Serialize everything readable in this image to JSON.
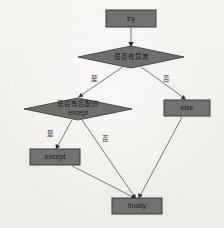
{
  "diagram": {
    "type": "flowchart",
    "background_color": "#f3f2ef",
    "node_fill_color": "#727272",
    "node_stroke_color": "#3a3a3a",
    "edge_color": "#6a6a6a",
    "nodes": [
      {
        "id": "try",
        "shape": "rect",
        "label": "try",
        "label_line2": "",
        "x": 131,
        "y": 18,
        "w": 50,
        "h": 17
      },
      {
        "id": "has-exception",
        "shape": "diamond",
        "label": "是否有异常",
        "label_line2": "",
        "x": 131,
        "y": 57,
        "w": 105,
        "h": 22
      },
      {
        "id": "has-matching-except",
        "shape": "diamond",
        "label": "是否有匹配的",
        "label_line2": "except",
        "x": 78,
        "y": 109,
        "w": 108,
        "h": 22
      },
      {
        "id": "else",
        "shape": "rect",
        "label": "else",
        "label_line2": "",
        "x": 187,
        "y": 108,
        "w": 46,
        "h": 16
      },
      {
        "id": "except",
        "shape": "rect",
        "label": "except",
        "label_line2": "",
        "x": 55,
        "y": 157,
        "w": 50,
        "h": 16
      },
      {
        "id": "finally",
        "shape": "rect",
        "label": "finally",
        "label_line2": "",
        "x": 137,
        "y": 206,
        "w": 50,
        "h": 16
      }
    ],
    "edges": [
      {
        "id": "try-to-has-exception",
        "from": "try",
        "to": "has-exception",
        "label": ""
      },
      {
        "id": "has-exception-yes",
        "from": "has-exception",
        "to": "has-matching-except",
        "label": "是"
      },
      {
        "id": "has-exception-no",
        "from": "has-exception",
        "to": "else",
        "label": "否"
      },
      {
        "id": "has-matching-except-yes",
        "from": "has-matching-except",
        "to": "except",
        "label": "是"
      },
      {
        "id": "has-matching-except-no",
        "from": "has-matching-except",
        "to": "finally",
        "label": "否"
      },
      {
        "id": "except-to-finally",
        "from": "except",
        "to": "finally",
        "label": ""
      },
      {
        "id": "else-to-finally",
        "from": "else",
        "to": "finally",
        "label": ""
      }
    ],
    "edge_labels": [
      {
        "id": "label-yes-top",
        "text": "是",
        "x": 94,
        "y": 79
      },
      {
        "id": "label-no-top",
        "text": "否",
        "x": 166,
        "y": 79
      },
      {
        "id": "label-yes-bottom",
        "text": "是",
        "x": 50,
        "y": 134
      },
      {
        "id": "label-no-bottom",
        "text": "否",
        "x": 105,
        "y": 139
      }
    ]
  }
}
